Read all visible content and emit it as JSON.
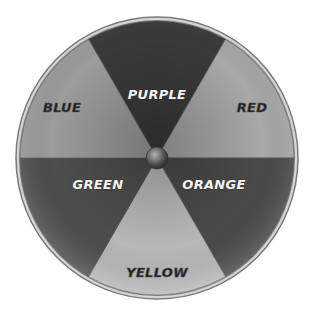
{
  "wheel": {
    "center": [
      157,
      158
    ],
    "radius": 137,
    "slices": [
      {
        "label": "PURPLE",
        "tone": "dark",
        "start_deg": -30,
        "end_deg": 30,
        "fill": "#3a3a3a",
        "text_style": "light",
        "text_pos": [
          157,
          99
        ]
      },
      {
        "label": "RED",
        "tone": "light",
        "start_deg": 30,
        "end_deg": 90,
        "fill": "#a8a8a8",
        "text_style": "dark",
        "text_pos": [
          252,
          112
        ]
      },
      {
        "label": "ORANGE",
        "tone": "dark",
        "start_deg": 90,
        "end_deg": 150,
        "fill": "#4a4a4a",
        "text_style": "light",
        "text_pos": [
          214,
          189
        ]
      },
      {
        "label": "YELLOW",
        "tone": "light",
        "start_deg": 150,
        "end_deg": 210,
        "fill": "#b8b8b8",
        "text_style": "dark",
        "text_pos": [
          157,
          277
        ]
      },
      {
        "label": "GREEN",
        "tone": "dark",
        "start_deg": 210,
        "end_deg": 270,
        "fill": "#4e4e4e",
        "text_style": "light",
        "text_pos": [
          98,
          189
        ]
      },
      {
        "label": "BLUE",
        "tone": "light",
        "start_deg": 270,
        "end_deg": 330,
        "fill": "#9c9c9c",
        "text_style": "dark",
        "text_pos": [
          62,
          112
        ]
      }
    ],
    "rim_color": "#8a8a8a",
    "hub_color": "#6a6a6a"
  }
}
